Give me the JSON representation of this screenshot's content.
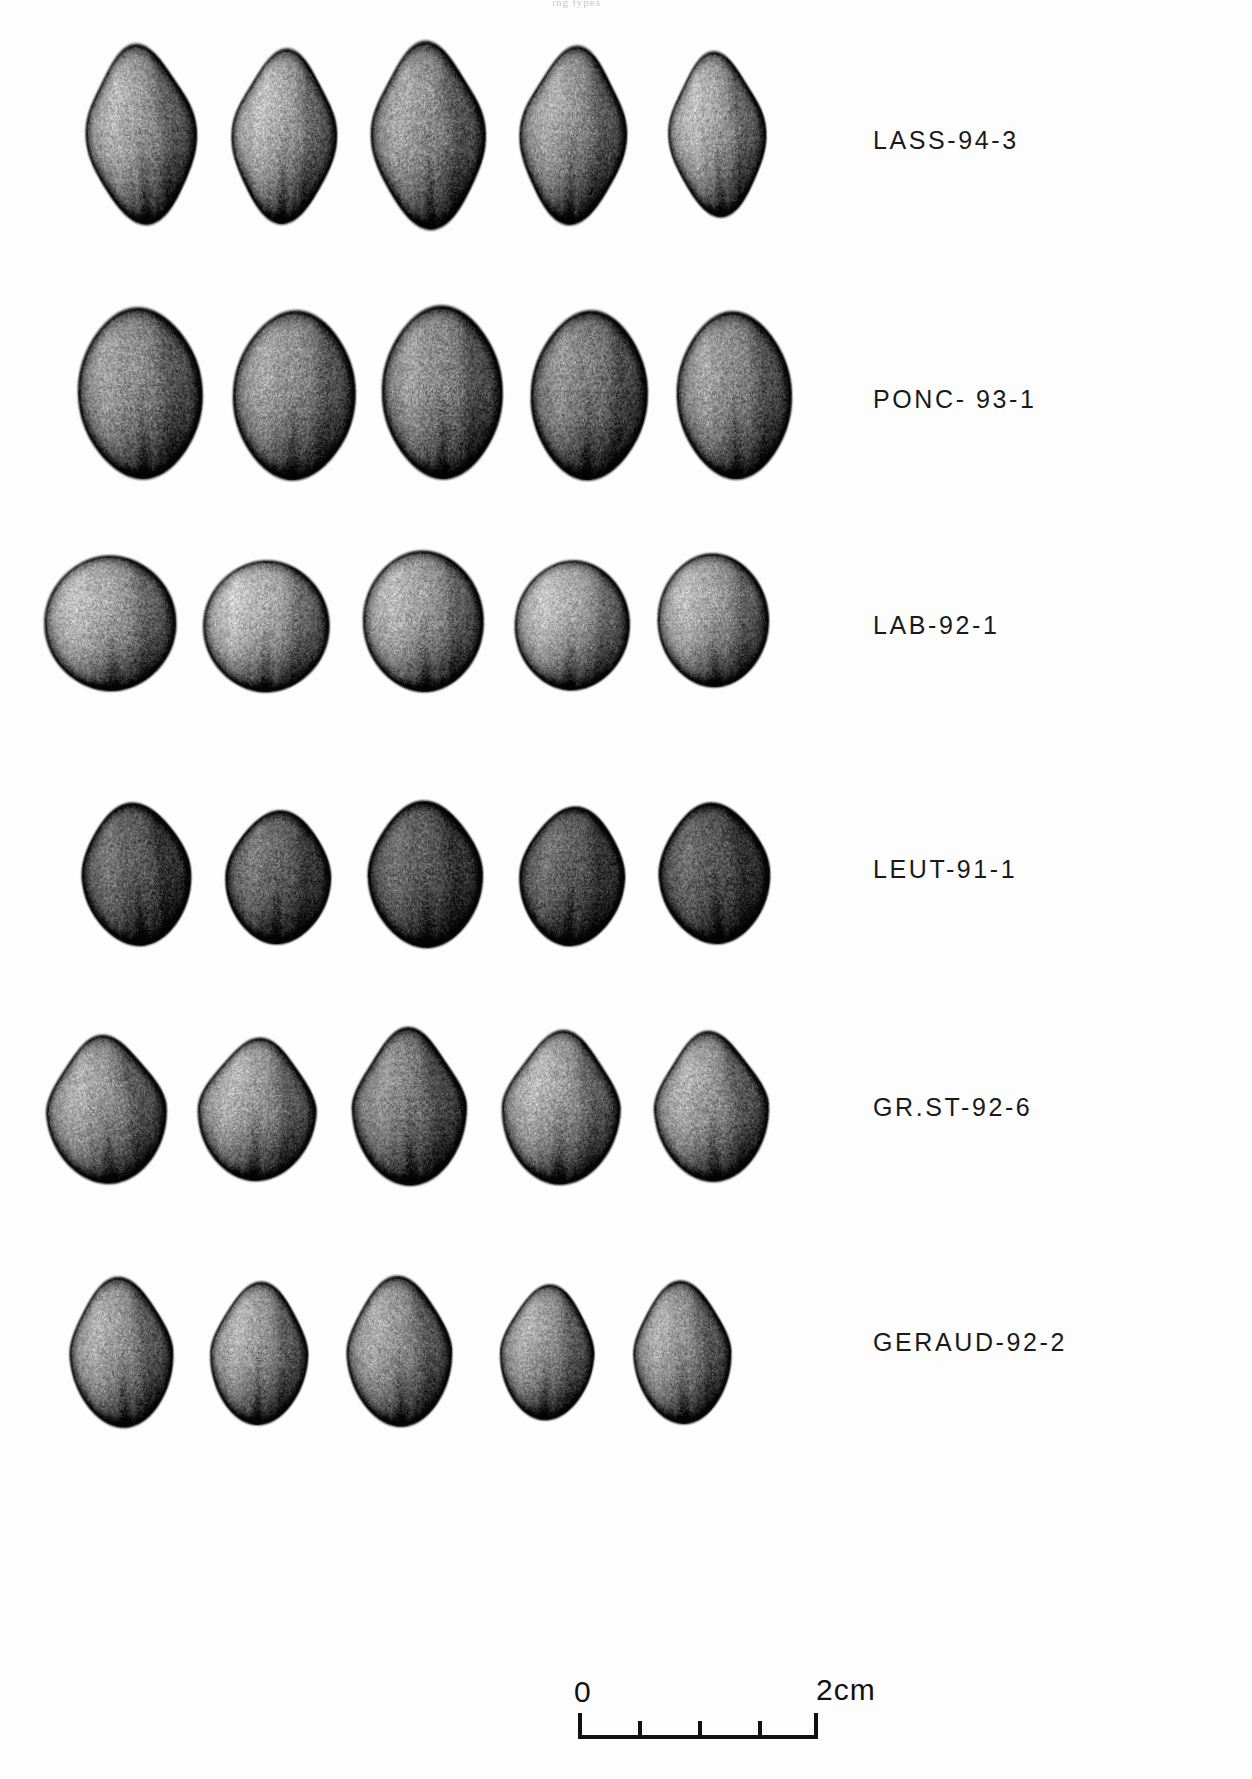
{
  "figure": {
    "type": "photographic-plate",
    "rows": 6,
    "specimens_per_row": 5,
    "background_color": "#fdfdfd",
    "ink_color": "#1a1a1a"
  },
  "top_artifact": {
    "text": "ing types"
  },
  "rows": [
    {
      "id": "row-lass",
      "label": "LASS-94-3",
      "label_x": 873,
      "label_y": 126,
      "top": 38,
      "tone": "mid",
      "shape": "ovate-pointed",
      "specimens": [
        {
          "x": 82,
          "y": 38,
          "w": 118,
          "h": 192,
          "tilt": -4,
          "tone": 0.52
        },
        {
          "x": 228,
          "y": 43,
          "w": 112,
          "h": 186,
          "tilt": 2,
          "tone": 0.55
        },
        {
          "x": 367,
          "y": 35,
          "w": 122,
          "h": 200,
          "tilt": -2,
          "tone": 0.48
        },
        {
          "x": 516,
          "y": 40,
          "w": 114,
          "h": 190,
          "tilt": 3,
          "tone": 0.5
        },
        {
          "x": 665,
          "y": 46,
          "w": 104,
          "h": 176,
          "tilt": -3,
          "tone": 0.54
        }
      ]
    },
    {
      "id": "row-ponc",
      "label": "PONC- 93-1",
      "label_x": 873,
      "label_y": 385,
      "top": 300,
      "tone": "mid-dark",
      "shape": "broad-ovate",
      "specimens": [
        {
          "x": 74,
          "y": 302,
          "w": 132,
          "h": 182,
          "tilt": -3,
          "tone": 0.46
        },
        {
          "x": 229,
          "y": 305,
          "w": 130,
          "h": 180,
          "tilt": 2,
          "tone": 0.47
        },
        {
          "x": 378,
          "y": 300,
          "w": 128,
          "h": 184,
          "tilt": -1,
          "tone": 0.45
        },
        {
          "x": 527,
          "y": 305,
          "w": 124,
          "h": 180,
          "tilt": 2,
          "tone": 0.42
        },
        {
          "x": 673,
          "y": 306,
          "w": 122,
          "h": 178,
          "tilt": -2,
          "tone": 0.46
        }
      ]
    },
    {
      "id": "row-lab",
      "label": "LAB-92-1",
      "label_x": 873,
      "label_y": 611,
      "top": 544,
      "tone": "mid-light",
      "shape": "round-ovate",
      "specimens": [
        {
          "x": 40,
          "y": 551,
          "w": 140,
          "h": 144,
          "tilt": -3,
          "tone": 0.55
        },
        {
          "x": 199,
          "y": 556,
          "w": 134,
          "h": 140,
          "tilt": 2,
          "tone": 0.57
        },
        {
          "x": 359,
          "y": 546,
          "w": 128,
          "h": 150,
          "tilt": -2,
          "tone": 0.53
        },
        {
          "x": 511,
          "y": 556,
          "w": 122,
          "h": 138,
          "tilt": 3,
          "tone": 0.56
        },
        {
          "x": 654,
          "y": 549,
          "w": 118,
          "h": 142,
          "tilt": -2,
          "tone": 0.54
        }
      ]
    },
    {
      "id": "row-leut",
      "label": "LEUT-91-1",
      "label_x": 873,
      "label_y": 855,
      "top": 795,
      "tone": "dark",
      "shape": "ovate-rugose",
      "specimens": [
        {
          "x": 78,
          "y": 798,
          "w": 116,
          "h": 152,
          "tilt": -5,
          "tone": 0.33
        },
        {
          "x": 222,
          "y": 806,
          "w": 112,
          "h": 142,
          "tilt": 3,
          "tone": 0.34
        },
        {
          "x": 364,
          "y": 796,
          "w": 122,
          "h": 156,
          "tilt": -2,
          "tone": 0.3
        },
        {
          "x": 516,
          "y": 802,
          "w": 112,
          "h": 148,
          "tilt": 4,
          "tone": 0.32
        },
        {
          "x": 655,
          "y": 798,
          "w": 118,
          "h": 150,
          "tilt": -4,
          "tone": 0.29
        }
      ]
    },
    {
      "id": "row-grst",
      "label": "GR.ST-92-6",
      "label_x": 873,
      "label_y": 1093,
      "top": 1021,
      "tone": "mid",
      "shape": "teardrop",
      "specimens": [
        {
          "x": 42,
          "y": 1030,
          "w": 128,
          "h": 158,
          "tilt": -4,
          "tone": 0.5
        },
        {
          "x": 194,
          "y": 1033,
          "w": 126,
          "h": 152,
          "tilt": 3,
          "tone": 0.52
        },
        {
          "x": 348,
          "y": 1022,
          "w": 122,
          "h": 168,
          "tilt": -1,
          "tone": 0.43
        },
        {
          "x": 498,
          "y": 1025,
          "w": 126,
          "h": 164,
          "tilt": 2,
          "tone": 0.53
        },
        {
          "x": 650,
          "y": 1026,
          "w": 122,
          "h": 160,
          "tilt": -3,
          "tone": 0.51
        }
      ]
    },
    {
      "id": "row-geraud",
      "label": "GERAUD-92-2",
      "label_x": 873,
      "label_y": 1328,
      "top": 1267,
      "tone": "mid",
      "shape": "narrow-ovate",
      "specimens": [
        {
          "x": 66,
          "y": 1272,
          "w": 110,
          "h": 160,
          "tilt": -3,
          "tone": 0.5
        },
        {
          "x": 207,
          "y": 1277,
          "w": 104,
          "h": 152,
          "tilt": 2,
          "tone": 0.52
        },
        {
          "x": 343,
          "y": 1271,
          "w": 112,
          "h": 160,
          "tilt": -2,
          "tone": 0.49
        },
        {
          "x": 497,
          "y": 1280,
          "w": 100,
          "h": 144,
          "tilt": 3,
          "tone": 0.51
        },
        {
          "x": 630,
          "y": 1276,
          "w": 104,
          "h": 152,
          "tilt": -2,
          "tone": 0.5
        }
      ]
    }
  ],
  "scalebar": {
    "start_label": "0",
    "end_label": "2cm",
    "x": 578,
    "y": 1713,
    "width": 240,
    "divisions": 4,
    "tick_values": [
      "0",
      "0.5",
      "1",
      "1.5",
      "2"
    ],
    "unit": "cm",
    "total_length_cm": 2
  }
}
